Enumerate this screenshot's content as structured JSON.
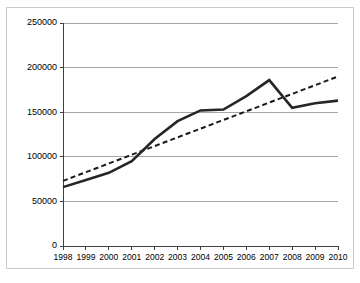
{
  "chart_data": {
    "type": "line",
    "title": "",
    "xlabel": "",
    "ylabel": "",
    "categories": [
      "1998",
      "1999",
      "2000",
      "2001",
      "2002",
      "2003",
      "2004",
      "2005",
      "2006",
      "2007",
      "2008",
      "2009",
      "2010"
    ],
    "ylim": [
      0,
      250000
    ],
    "yticks": [
      0,
      50000,
      100000,
      150000,
      200000,
      250000
    ],
    "ytick_labels": [
      "0",
      "50000",
      "100000",
      "150000",
      "200000",
      "250000"
    ],
    "grid": true,
    "legend": "none",
    "series": [
      {
        "name": "data",
        "style": "solid",
        "color": "#262626",
        "values": [
          66000,
          74000,
          82000,
          95000,
          120000,
          140000,
          152000,
          153000,
          168000,
          186000,
          155000,
          160000,
          163000
        ]
      },
      {
        "name": "trendline",
        "style": "dashed",
        "color": "#1a1a1a",
        "values": [
          73000,
          82800,
          92500,
          102300,
          112000,
          121800,
          131500,
          141300,
          151000,
          160800,
          170500,
          180300,
          190000
        ]
      }
    ]
  }
}
